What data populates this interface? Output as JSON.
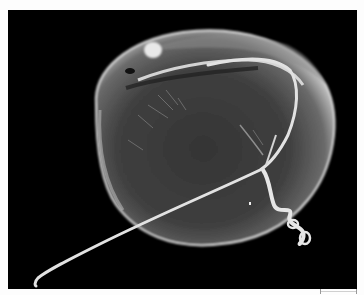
{
  "image": {
    "kind": "scanning-electron-micrograph",
    "subject": "dinoflagellate cell with transverse and longitudinal flagella",
    "background_color": "#000000",
    "border_color": "#fdfdfd",
    "subject_tones": [
      "#3a3a3a",
      "#5c5c5c",
      "#9a9a9a",
      "#e6e6e6"
    ]
  },
  "scale_bar": {
    "visible": true,
    "label": ""
  }
}
